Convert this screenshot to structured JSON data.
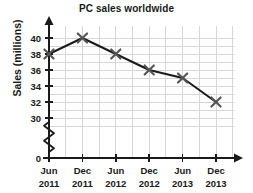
{
  "chart_data": {
    "type": "line",
    "title": "PC sales worldwide",
    "xlabel": "",
    "ylabel": "Sales (millions)",
    "categories": [
      "Jun 2011",
      "Dec 2011",
      "Jun 2012",
      "Dec 2012",
      "Jun 2013",
      "Dec 2013"
    ],
    "x_tick_lines": [
      {
        "month": "Jun",
        "year": "2011"
      },
      {
        "month": "Dec",
        "year": "2011"
      },
      {
        "month": "Jun",
        "year": "2012"
      },
      {
        "month": "Dec",
        "year": "2012"
      },
      {
        "month": "Jun",
        "year": "2013"
      },
      {
        "month": "Dec",
        "year": "2013"
      }
    ],
    "values": [
      38,
      40,
      38,
      36,
      35,
      32
    ],
    "y_tick_labels": [
      "0",
      "30",
      "32",
      "34",
      "36",
      "38",
      "40"
    ],
    "ylim": [
      30,
      41
    ],
    "y_axis_break": true,
    "grid": true,
    "legend": "none",
    "marker": "x",
    "line_color": "#1a1a1a",
    "marker_color": "#555555",
    "grid_color": "#d7d7d7",
    "axis_color": "#1a1a1a",
    "background": "#ffffff"
  }
}
